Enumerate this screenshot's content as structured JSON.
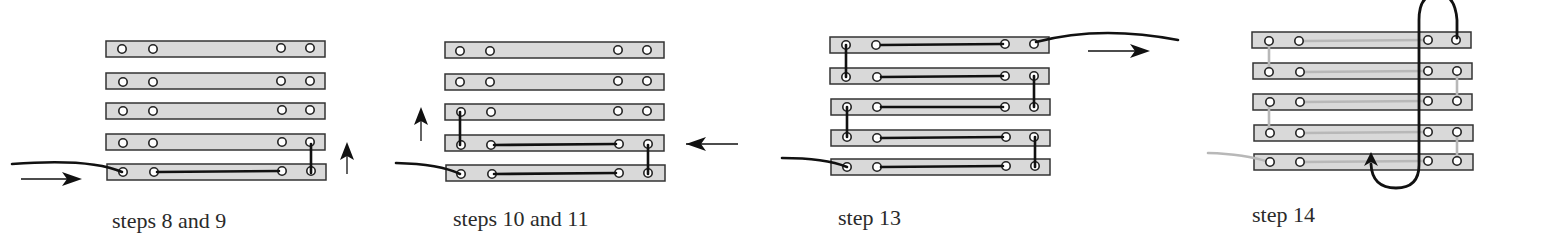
{
  "colors": {
    "slat_fill": "#d9d9d9",
    "slat_stroke": "#333333",
    "thread_dark": "#111111",
    "thread_light": "#b8b8b8",
    "hole_fill": "#ffffff",
    "caption_text": "#2a2a2a"
  },
  "panels": [
    {
      "id": "p1",
      "caption": "steps 8 and 9"
    },
    {
      "id": "p2",
      "caption": "steps 10 and 11"
    },
    {
      "id": "p3",
      "caption": "step 13"
    },
    {
      "id": "p4",
      "caption": "step 14"
    }
  ],
  "diagram": {
    "slat_count_per_panel": 5,
    "holes_per_slat": 4,
    "arrows": [
      {
        "panel": "p1",
        "direction": "right",
        "icon": "arrow-right-icon"
      },
      {
        "panel": "p1",
        "direction": "up",
        "icon": "arrow-up-icon"
      },
      {
        "panel": "p2",
        "direction": "up",
        "icon": "arrow-up-icon"
      },
      {
        "panel": "p2",
        "direction": "left",
        "icon": "arrow-left-icon"
      },
      {
        "panel": "p3",
        "direction": "right",
        "icon": "arrow-right-icon"
      },
      {
        "panel": "p4",
        "direction": "up",
        "icon": "arrow-up-icon"
      }
    ]
  }
}
